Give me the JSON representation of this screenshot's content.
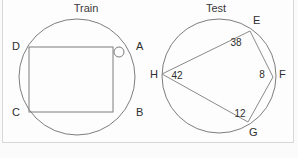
{
  "figures": [
    {
      "title": "Train",
      "shape": "circle-with-inscribed-rectangle",
      "points": [
        {
          "label": "D",
          "x": 25,
          "y": 46
        },
        {
          "label": "A",
          "x": 139,
          "y": 46
        },
        {
          "label": "C",
          "x": 25,
          "y": 112
        },
        {
          "label": "B",
          "x": 139,
          "y": 112
        }
      ],
      "marker": {
        "name": "small-circle-marker",
        "cx": 119,
        "cy": 52,
        "r": 5
      },
      "circle": {
        "cx": 77,
        "cy": 77,
        "r": 58
      }
    },
    {
      "title": "Test",
      "shape": "circle-with-chords",
      "points": [
        {
          "label": "E",
          "x": 253,
          "y": 26
        },
        {
          "label": "F",
          "x": 277,
          "y": 74
        },
        {
          "label": "G",
          "x": 250,
          "y": 127
        },
        {
          "label": "H",
          "x": 156,
          "y": 74
        }
      ],
      "arc_values": [
        {
          "value": "38",
          "x": 240,
          "y": 42
        },
        {
          "value": "8",
          "x": 262,
          "y": 77
        },
        {
          "value": "42",
          "x": 177,
          "y": 78
        },
        {
          "value": "12",
          "x": 242,
          "y": 115
        }
      ],
      "circle": {
        "cx": 219,
        "cy": 74,
        "r": 58
      }
    }
  ],
  "colors": {
    "background": "#fbfbfb",
    "panel": "#fdfdfd",
    "panel_border": "#d8d8d8",
    "stroke": "#7d7d7d",
    "text": "#2e2e2e"
  }
}
